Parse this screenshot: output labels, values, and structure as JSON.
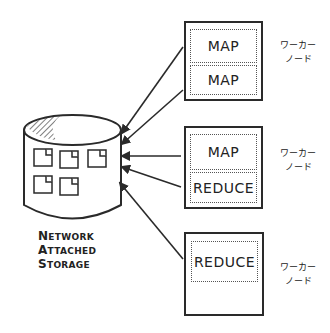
{
  "storage": {
    "line1_initial": "N",
    "line1_rest": "ETWORK",
    "line2_initial": "A",
    "line2_rest": "TTACHED",
    "line3_initial": "S",
    "line3_rest": "TORAGE",
    "icon": "database-cylinder-icon"
  },
  "nodes": [
    {
      "label": "ワーカー\nノード",
      "label_line1": "ワーカー",
      "label_line2": "ノード",
      "tasks": [
        "MAP",
        "MAP"
      ]
    },
    {
      "label_line1": "ワーカー",
      "label_line2": "ノード",
      "tasks": [
        "MAP",
        "REDUCE"
      ]
    },
    {
      "label_line1": "ワーカー",
      "label_line2": "ノード",
      "tasks": [
        "REDUCE"
      ]
    }
  ],
  "arrows": {
    "count": 5,
    "direction": "tasks-to-storage",
    "color": "#2a2a2a"
  },
  "colors": {
    "stroke": "#2a2a2a",
    "background": "#ffffff"
  }
}
